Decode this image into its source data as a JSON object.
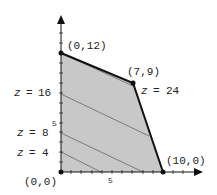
{
  "diagram": {
    "type": "feasible-region",
    "axes": {
      "x_tick_label": "5",
      "y_tick_label": "5"
    },
    "vertices": [
      {
        "label": "(0,0)",
        "x": 0,
        "y": 0
      },
      {
        "label": "(0,12)",
        "x": 0,
        "y": 12
      },
      {
        "label": "(7,9)",
        "x": 7,
        "y": 9
      },
      {
        "label": "(10,0)",
        "x": 10,
        "y": 0
      }
    ],
    "level_lines": [
      {
        "z": "z",
        "eq": "=",
        "value": "4"
      },
      {
        "z": "z",
        "eq": "=",
        "value": "8"
      },
      {
        "z": "z",
        "eq": "=",
        "value": "16"
      },
      {
        "z": "z",
        "eq": "=",
        "value": "24"
      }
    ],
    "colors": {
      "region": "#c8c8c8",
      "boundary": "#111111",
      "level_line": "#666666"
    }
  }
}
